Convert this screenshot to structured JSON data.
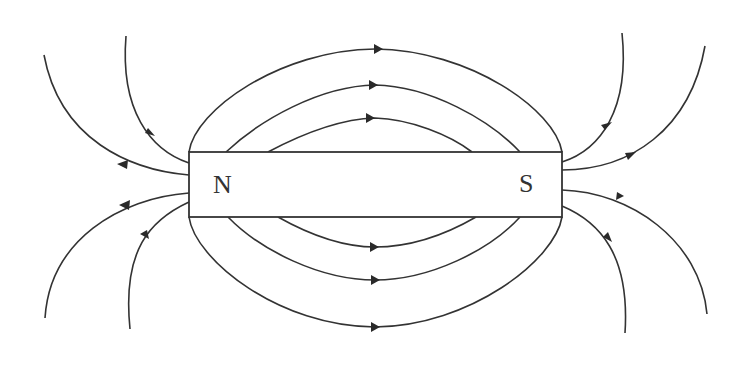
{
  "diagram": {
    "magnet": {
      "north_label": "N",
      "south_label": "S"
    },
    "field_direction": "from N pole to S pole outside the magnet",
    "field_line_groups": [
      {
        "name": "top-arcs",
        "count": 3,
        "arrow_direction": "right"
      },
      {
        "name": "bottom-arcs",
        "count": 3,
        "arrow_direction": "right"
      },
      {
        "name": "north-end-lines",
        "count": 4,
        "arrow_direction": "away-from-magnet"
      },
      {
        "name": "south-end-lines",
        "count": 4,
        "arrow_direction": "toward-magnet"
      }
    ],
    "colors": {
      "stroke": "#333333",
      "background": "#ffffff"
    }
  }
}
